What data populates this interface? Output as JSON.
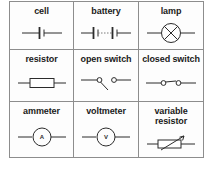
{
  "figure": {
    "type": "circuit-symbol-key",
    "rows": 3,
    "columns": 3,
    "border_color": "#8d8d8d",
    "symbol_color": "#2b2b2b",
    "background_color": "#ffffff"
  },
  "grid": [
    [
      {
        "label": "cell",
        "icon": "cell-symbol"
      },
      {
        "label": "battery",
        "icon": "battery-symbol"
      },
      {
        "label": "lamp",
        "icon": "lamp-symbol"
      }
    ],
    [
      {
        "label": "resistor",
        "icon": "resistor-symbol"
      },
      {
        "label": "open switch",
        "icon": "open-switch-symbol"
      },
      {
        "label": "closed switch",
        "icon": "closed-switch-symbol"
      }
    ],
    [
      {
        "label": "ammeter",
        "icon": "ammeter-symbol",
        "meter_letter": "A"
      },
      {
        "label": "voltmeter",
        "icon": "voltmeter-symbol",
        "meter_letter": "V"
      },
      {
        "label": "variable\nresistor",
        "icon": "variable-resistor-symbol"
      }
    ]
  ]
}
